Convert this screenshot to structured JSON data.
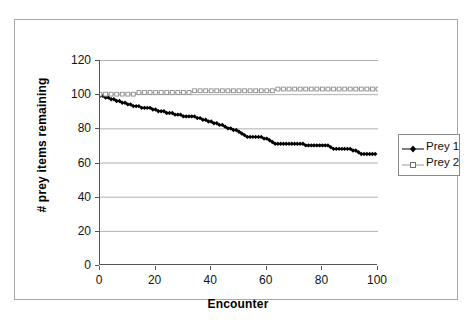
{
  "chart_data": {
    "type": "line",
    "title": "",
    "xlabel": "Encounter",
    "ylabel": "# prey items remaining",
    "xlim": [
      0,
      100
    ],
    "ylim": [
      0,
      120
    ],
    "xticks": [
      "0",
      "20",
      "40",
      "60",
      "80",
      "100"
    ],
    "yticks": [
      "0",
      "20",
      "40",
      "60",
      "80",
      "100",
      "120"
    ],
    "grid": "horizontal",
    "legend_position": "right",
    "series": [
      {
        "name": "Prey 1",
        "color": "#000000",
        "marker": "filled-diamond",
        "x": [
          0,
          2,
          4,
          6,
          8,
          10,
          12,
          14,
          16,
          18,
          20,
          22,
          24,
          26,
          28,
          30,
          32,
          34,
          36,
          38,
          40,
          42,
          44,
          46,
          48,
          50,
          52,
          54,
          56,
          58,
          60,
          62,
          64,
          66,
          68,
          70,
          72,
          74,
          76,
          78,
          80,
          82,
          84,
          86,
          88,
          90,
          92,
          94,
          96,
          98,
          100
        ],
        "values": [
          99,
          98,
          97,
          96,
          95,
          94,
          93,
          93,
          92,
          92,
          91,
          90,
          90,
          89,
          88,
          88,
          87,
          87,
          87,
          86,
          85,
          84,
          83,
          82,
          81,
          80,
          79,
          78,
          77,
          76,
          75,
          75,
          75,
          75,
          74,
          74,
          73,
          72,
          71,
          71,
          71,
          71,
          71,
          71,
          71,
          71,
          70,
          70,
          70,
          69,
          69
        ]
      },
      {
        "name": "Prey 2",
        "color": "#9a9a9a",
        "marker": "open-square",
        "x": [
          0,
          2,
          4,
          6,
          8,
          10,
          12,
          14,
          16,
          18,
          20,
          22,
          24,
          26,
          28,
          30,
          32,
          34,
          36,
          38,
          40,
          42,
          44,
          46,
          48,
          50,
          52,
          54,
          56,
          58,
          60,
          62,
          64,
          66,
          68,
          70,
          72,
          74,
          76,
          78,
          80,
          82,
          84,
          86,
          88,
          90,
          92,
          94,
          96,
          98,
          100
        ],
        "values": [
          100,
          100,
          100,
          100,
          100,
          100,
          100,
          101,
          101,
          101,
          101,
          101,
          101,
          101,
          101,
          101,
          101,
          102,
          102,
          102,
          102,
          102,
          102,
          102,
          102,
          102,
          102,
          102,
          102,
          102,
          102,
          102,
          103,
          103,
          103,
          103,
          103,
          103,
          103,
          103,
          103,
          103,
          103,
          103,
          103,
          103,
          103,
          103,
          103,
          103,
          103
        ]
      }
    ],
    "series_detail": {
      "prey1_full": {
        "x": [
          0,
          1,
          2,
          3,
          4,
          5,
          6,
          7,
          8,
          9,
          10,
          11,
          12,
          13,
          14,
          15,
          16,
          17,
          18,
          19,
          20,
          21,
          22,
          23,
          24,
          25,
          26,
          27,
          28,
          29,
          30,
          31,
          32,
          33,
          34,
          35,
          36,
          37,
          38,
          39,
          40,
          41,
          42,
          43,
          44,
          45,
          46,
          47,
          48,
          49,
          50,
          51,
          52,
          53,
          54,
          55,
          56,
          57,
          58,
          59,
          60,
          61,
          62,
          63,
          64,
          65,
          66,
          67,
          68,
          69,
          70,
          71,
          72,
          73,
          74,
          75,
          76,
          77,
          78,
          79,
          80,
          81,
          82,
          83,
          84,
          85,
          86,
          87,
          88,
          89,
          90,
          91,
          92,
          93,
          94,
          95,
          96,
          97,
          98,
          99
        ],
        "values": [
          99,
          99,
          98,
          98,
          97,
          97,
          96,
          96,
          95,
          95,
          94,
          94,
          93,
          93,
          93,
          92,
          92,
          92,
          92,
          91,
          91,
          90,
          90,
          90,
          89,
          89,
          89,
          88,
          88,
          88,
          87,
          87,
          87,
          87,
          87,
          86,
          86,
          85,
          85,
          84,
          84,
          83,
          83,
          82,
          82,
          81,
          80,
          80,
          79,
          79,
          78,
          77,
          76,
          75,
          75,
          75,
          75,
          75,
          75,
          74,
          74,
          73,
          72,
          71,
          71,
          71,
          71,
          71,
          71,
          71,
          71,
          71,
          71,
          71,
          70,
          70,
          70,
          70,
          70,
          70,
          70,
          70,
          70,
          69,
          68,
          68,
          68,
          68,
          68,
          68,
          68,
          67,
          67,
          66,
          65,
          65,
          65,
          65,
          65,
          65
        ]
      }
    }
  },
  "legend": {
    "entries": [
      {
        "label": "Prey 1"
      },
      {
        "label": "Prey 2"
      }
    ]
  },
  "axes": {
    "x_title": "Encounter",
    "y_title": "# prey items remaining"
  }
}
